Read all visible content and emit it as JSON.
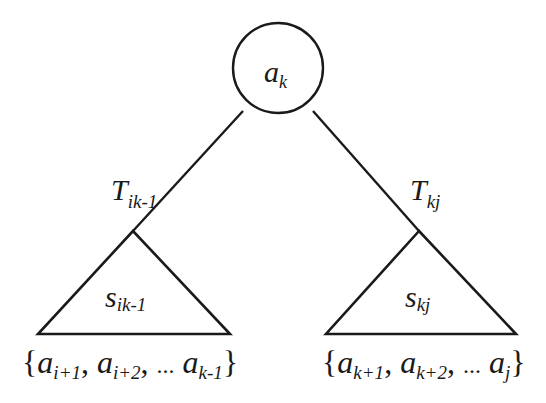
{
  "diagram": {
    "type": "binary-search-tree-decomposition",
    "root": {
      "label": "a",
      "subscript": "k"
    },
    "left_edge": {
      "label": "T",
      "subscript": "ik-1"
    },
    "right_edge": {
      "label": "T",
      "subscript": "kj"
    },
    "left_subtree": {
      "label": "s",
      "subscript": "ik-1",
      "set": {
        "open": "{",
        "items": [
          {
            "base": "a",
            "sub": "i+1"
          },
          {
            "base": "a",
            "sub": "i+2"
          },
          {
            "base": "a",
            "sub": "k-1"
          }
        ],
        "separator": ",",
        "ellipsis": "...",
        "close": "}"
      }
    },
    "right_subtree": {
      "label": "s",
      "subscript": "kj",
      "set": {
        "open": "{",
        "items": [
          {
            "base": "a",
            "sub": "k+1"
          },
          {
            "base": "a",
            "sub": "k+2"
          },
          {
            "base": "a",
            "sub": "j"
          }
        ],
        "separator": ",",
        "ellipsis": "...",
        "close": "}"
      }
    },
    "colors": {
      "stroke": "#1a1a1a",
      "background": "#ffffff"
    }
  }
}
